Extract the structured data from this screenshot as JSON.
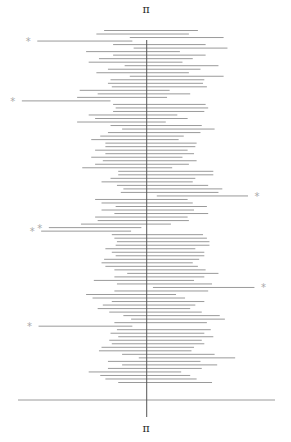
{
  "chart_data": {
    "type": "interval",
    "title": "",
    "top_label": "π",
    "bottom_label": "π",
    "reference_value": 3.14159,
    "reference_label": "π",
    "xlim": [
      2.14,
      4.14
    ],
    "miss_marker": "*",
    "colors": {
      "interval": "#9a9a9a",
      "reference": "#555555",
      "axis": "#9a9a9a",
      "marker": "#aaaaaa"
    },
    "intervals": [
      [
        2.81,
        3.54
      ],
      [
        2.75,
        3.47
      ],
      [
        3.01,
        3.74
      ],
      [
        2.29,
        3.03
      ],
      [
        2.88,
        3.6
      ],
      [
        3.04,
        3.77
      ],
      [
        2.67,
        3.4
      ],
      [
        2.88,
        3.6
      ],
      [
        2.77,
        3.5
      ],
      [
        2.69,
        3.42
      ],
      [
        2.97,
        3.7
      ],
      [
        2.84,
        3.56
      ],
      [
        2.75,
        3.47
      ],
      [
        3.01,
        3.74
      ],
      [
        2.86,
        3.59
      ],
      [
        2.84,
        3.58
      ],
      [
        2.87,
        3.61
      ],
      [
        2.62,
        3.32
      ],
      [
        2.76,
        3.48
      ],
      [
        2.6,
        3.3
      ],
      [
        2.17,
        2.86
      ],
      [
        2.88,
        3.6
      ],
      [
        2.9,
        3.62
      ],
      [
        2.88,
        3.59
      ],
      [
        2.69,
        3.38
      ],
      [
        2.74,
        3.46
      ],
      [
        2.6,
        3.29
      ],
      [
        2.86,
        3.57
      ],
      [
        2.95,
        3.67
      ],
      [
        2.84,
        3.56
      ],
      [
        2.78,
        3.43
      ],
      [
        2.71,
        3.39
      ],
      [
        2.82,
        3.53
      ],
      [
        2.82,
        3.52
      ],
      [
        2.74,
        3.46
      ],
      [
        2.82,
        3.51
      ],
      [
        2.71,
        3.42
      ],
      [
        2.8,
        3.53
      ],
      [
        2.74,
        3.47
      ],
      [
        2.64,
        3.34
      ],
      [
        2.92,
        3.66
      ],
      [
        2.92,
        3.66
      ],
      [
        2.86,
        3.52
      ],
      [
        2.79,
        3.5
      ],
      [
        2.91,
        3.62
      ],
      [
        2.96,
        3.73
      ],
      [
        2.94,
        3.7
      ],
      [
        3.22,
        3.93
      ],
      [
        2.74,
        3.46
      ],
      [
        2.79,
        3.5
      ],
      [
        2.9,
        3.61
      ],
      [
        2.79,
        3.51
      ],
      [
        2.89,
        3.62
      ],
      [
        2.74,
        3.46
      ],
      [
        2.76,
        3.47
      ],
      [
        2.63,
        3.33
      ],
      [
        2.38,
        3.1
      ],
      [
        2.32,
        3.02
      ],
      [
        2.87,
        3.58
      ],
      [
        2.89,
        3.61
      ],
      [
        2.91,
        3.63
      ],
      [
        2.9,
        3.63
      ],
      [
        2.82,
        3.52
      ],
      [
        2.87,
        3.59
      ],
      [
        2.9,
        3.59
      ],
      [
        2.81,
        3.55
      ],
      [
        2.79,
        3.5
      ],
      [
        2.82,
        3.54
      ],
      [
        2.89,
        3.6
      ],
      [
        2.99,
        3.7
      ],
      [
        2.89,
        3.59
      ],
      [
        2.73,
        3.51
      ],
      [
        2.91,
        3.65
      ],
      [
        3.19,
        3.98
      ],
      [
        2.89,
        3.62
      ],
      [
        2.67,
        3.37
      ],
      [
        2.72,
        3.44
      ],
      [
        2.87,
        3.59
      ],
      [
        2.8,
        3.52
      ],
      [
        2.76,
        3.48
      ],
      [
        2.85,
        3.57
      ],
      [
        2.96,
        3.71
      ],
      [
        3.02,
        3.75
      ],
      [
        2.89,
        3.61
      ],
      [
        2.3,
        3.03
      ],
      [
        2.91,
        3.64
      ],
      [
        2.86,
        3.59
      ],
      [
        2.92,
        3.66
      ],
      [
        2.85,
        3.57
      ],
      [
        2.87,
        3.59
      ],
      [
        2.79,
        3.51
      ],
      [
        2.77,
        3.49
      ],
      [
        2.95,
        3.67
      ],
      [
        3.08,
        3.83
      ],
      [
        2.84,
        3.56
      ],
      [
        2.95,
        3.69
      ],
      [
        2.84,
        3.57
      ],
      [
        2.69,
        3.41
      ],
      [
        2.78,
        3.48
      ],
      [
        2.82,
        3.53
      ],
      [
        2.92,
        3.65
      ]
    ],
    "misses_pi": "intervals not containing the reference value are flagged with the marker"
  }
}
